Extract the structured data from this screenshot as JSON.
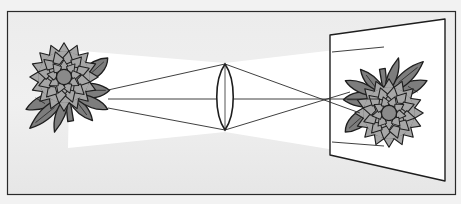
{
  "diagram": {
    "title": "Convex lens projecting an inverted image of a flower onto a screen",
    "elements": {
      "object": "flower (dahlia) with leaves",
      "lens": "biconvex converging lens",
      "screen": "projection screen",
      "image": "inverted flower"
    },
    "rays": 3,
    "colors": {
      "background": "#f2f2f2",
      "frame_fill": "#e9e9e9",
      "frame_stroke": "#2a2a2a",
      "beam": "#ffffff",
      "leaf": "#7d7d7d",
      "petal": "#a6a6a6",
      "center": "#8a8a8a",
      "outline": "#1e1e1e"
    }
  }
}
